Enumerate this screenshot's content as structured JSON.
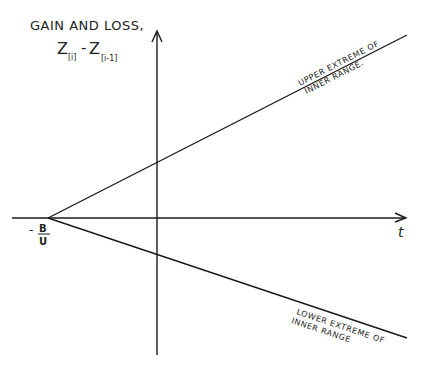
{
  "diagram": {
    "y_axis_label": "GAIN AND LOSS,",
    "y_axis_expr": {
      "z1": "Z",
      "sub1": "[i]",
      "minus": "-",
      "z2": "Z",
      "sub2": "[i-1]"
    },
    "x_axis_label": "t",
    "origin_label": {
      "sign": "-",
      "numerator": "B",
      "denominator": "U"
    },
    "upper_line_label": {
      "line1": "UPPER EXTREME OF",
      "line2": "INNER RANGE."
    },
    "lower_line_label": {
      "line1": "LOWER EXTREME OF",
      "line2": "INNER RANGE"
    },
    "colors": {
      "ink": "#1a1a1a",
      "background": "#ffffff"
    }
  }
}
